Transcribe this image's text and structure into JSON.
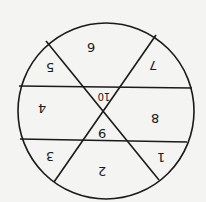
{
  "diagram": {
    "type": "circle divided into regions",
    "orientation": "rotated 180 degrees",
    "stroke_color": "#1a1a1a",
    "background": "#f4f4f2",
    "circle": {
      "cx": 106,
      "cy": 111,
      "r": 88
    },
    "lines": [
      {
        "x1": 19,
        "y1": 86,
        "x2": 192,
        "y2": 88
      },
      {
        "x1": 20,
        "y1": 139,
        "x2": 187,
        "y2": 142
      },
      {
        "x1": 46,
        "y1": 41,
        "x2": 159,
        "y2": 180
      },
      {
        "x1": 156,
        "y1": 35,
        "x2": 54,
        "y2": 182
      }
    ],
    "regions": [
      {
        "label": "6",
        "x": 91,
        "y": 47
      },
      {
        "label": "7",
        "x": 153,
        "y": 65
      },
      {
        "label": "5",
        "x": 50,
        "y": 67
      },
      {
        "label": "10",
        "x": 104,
        "y": 96
      },
      {
        "label": "4",
        "x": 42,
        "y": 108
      },
      {
        "label": "8",
        "x": 155,
        "y": 118
      },
      {
        "label": "9",
        "x": 102,
        "y": 133
      },
      {
        "label": "3",
        "x": 50,
        "y": 156
      },
      {
        "label": "1",
        "x": 161,
        "y": 157
      },
      {
        "label": "2",
        "x": 102,
        "y": 171
      }
    ]
  }
}
